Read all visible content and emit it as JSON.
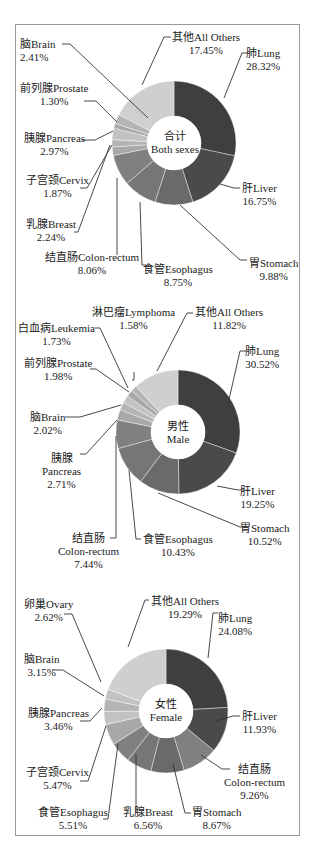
{
  "chart_data": [
    {
      "type": "pie",
      "subtype": "donut",
      "title": "合计 Both sexes",
      "center_label": {
        "zh": "合计",
        "en": "Both sexes"
      },
      "categories": [
        "肺Lung",
        "肝Liver",
        "胃Stomach",
        "食管Esophagus",
        "结直肠Colon-rectum",
        "乳腺Breast",
        "子宫颈Cervix",
        "胰腺Pancreas",
        "前列腺Prostate",
        "脑Brain",
        "其他All Others"
      ],
      "values": [
        28.32,
        16.75,
        9.88,
        8.75,
        8.06,
        2.24,
        1.87,
        2.97,
        1.3,
        2.41,
        17.45
      ],
      "value_labels": [
        "28.32%",
        "16.75%",
        "9.88%",
        "8.75%",
        "8.06%",
        "2.24%",
        "1.87%",
        "2.97%",
        "1.30%",
        "2.41%",
        "17.45%"
      ]
    },
    {
      "type": "pie",
      "subtype": "donut",
      "title": "男性 Male",
      "center_label": {
        "zh": "男性",
        "en": "Male"
      },
      "categories": [
        "肺Lung",
        "肝Liver",
        "胃Stomach",
        "食管Esophagus",
        "结直肠Colon-rectum",
        "胰腺Pancreas",
        "脑Brain",
        "前列腺Prostate",
        "白血病Leukemia",
        "淋巴瘤Lymphoma",
        "其他All Others"
      ],
      "values": [
        30.52,
        19.25,
        10.52,
        10.43,
        7.44,
        2.71,
        2.02,
        1.98,
        1.73,
        1.58,
        11.82
      ],
      "value_labels": [
        "30.52%",
        "19.25%",
        "10.52%",
        "10.43%",
        "7.44%",
        "2.71%",
        "2.02%",
        "1.98%",
        "1.73%",
        "1.58%",
        "11.82%"
      ]
    },
    {
      "type": "pie",
      "subtype": "donut",
      "title": "女性 Female",
      "center_label": {
        "zh": "女性",
        "en": "Female"
      },
      "categories": [
        "肺Lung",
        "肝Liver",
        "结直肠Colon-rectum",
        "胃Stomach",
        "乳腺Breast",
        "食管Esophagus",
        "子宫颈Cervix",
        "胰腺Pancreas",
        "脑Brain",
        "卵巢Ovary",
        "其他All Others"
      ],
      "values": [
        24.08,
        11.93,
        9.26,
        8.67,
        6.56,
        5.51,
        5.47,
        3.46,
        3.15,
        2.62,
        19.29
      ],
      "value_labels": [
        "24.08%",
        "11.93%",
        "9.26%",
        "8.67%",
        "6.56%",
        "5.51%",
        "5.47%",
        "3.46%",
        "3.15%",
        "2.62%",
        "19.29%"
      ]
    }
  ],
  "charts": [
    {
      "center": {
        "zh": "合计",
        "en": "Both sexes"
      },
      "labels": [
        {
          "name": "脑Brain",
          "pct": "2.41%"
        },
        {
          "name": "其他All Others",
          "pct": "17.45%"
        },
        {
          "name": "肺Lung",
          "pct": "28.32%"
        },
        {
          "name": "前列腺Prostate",
          "pct": "1.30%"
        },
        {
          "name": "胰腺Pancreas",
          "pct": "2.97%"
        },
        {
          "name": "子宫颈Cervix",
          "pct": "1.87%"
        },
        {
          "name": "肝Liver",
          "pct": "16.75%"
        },
        {
          "name": "乳腺Breast",
          "pct": "2.24%"
        },
        {
          "name": "结直肠Colon-rectum",
          "pct": "8.06%"
        },
        {
          "name": "食管Esophagus",
          "pct": "8.75%"
        },
        {
          "name": "胃Stomach",
          "pct": "9.88%"
        }
      ]
    },
    {
      "center": {
        "zh": "男性",
        "en": "Male"
      },
      "labels": [
        {
          "name": "淋巴瘤Lymphoma",
          "pct": "1.58%"
        },
        {
          "name": "其他All Others",
          "pct": "11.82%"
        },
        {
          "name": "白血病Leukemia",
          "pct": "1.73%"
        },
        {
          "name": "前列腺Prostate",
          "pct": "1.98%"
        },
        {
          "name": "肺Lung",
          "pct": "30.52%"
        },
        {
          "name": "脑Brain",
          "pct": "2.02%"
        },
        {
          "name_zh": "胰腺",
          "name_en": "Pancreas",
          "pct": "2.71%"
        },
        {
          "name": "肝Liver",
          "pct": "19.25%"
        },
        {
          "name": "胃Stomach",
          "pct": "10.52%"
        },
        {
          "name_zh": "结直肠",
          "name_en": "Colon-rectum",
          "pct": "7.44%"
        },
        {
          "name": "食管Esophagus",
          "pct": "10.43%"
        }
      ]
    },
    {
      "center": {
        "zh": "女性",
        "en": "Female"
      },
      "labels": [
        {
          "name": "卵巢Ovary",
          "pct": "2.62%"
        },
        {
          "name": "其他All Others",
          "pct": "19.29%"
        },
        {
          "name": "肺Lung",
          "pct": "24.08%"
        },
        {
          "name": "脑Brain",
          "pct": "3.15%"
        },
        {
          "name": "胰腺Pancreas",
          "pct": "3.46%"
        },
        {
          "name": "肝Liver",
          "pct": "11.93%"
        },
        {
          "name": "子宫颈Cervix",
          "pct": "5.47%"
        },
        {
          "name_zh": "结直肠",
          "name_en": "Colon-rectum",
          "pct": "9.26%"
        },
        {
          "name": "食管Esophagus",
          "pct": "5.51%"
        },
        {
          "name": "乳腺Breast",
          "pct": "6.56%"
        },
        {
          "name": "胃Stomach",
          "pct": "8.67%"
        }
      ]
    }
  ],
  "colors": {
    "lung": "#3f3f3f",
    "liver": "#4a4a4a",
    "stomach": "#6a6a6a",
    "esophagus": "#767676",
    "colon": "#808080",
    "small1": "#a8a8a8",
    "small2": "#b4b4b4",
    "small3": "#c2c2c2",
    "others": "#cfcfcf",
    "frame": "#9a9a9a"
  }
}
